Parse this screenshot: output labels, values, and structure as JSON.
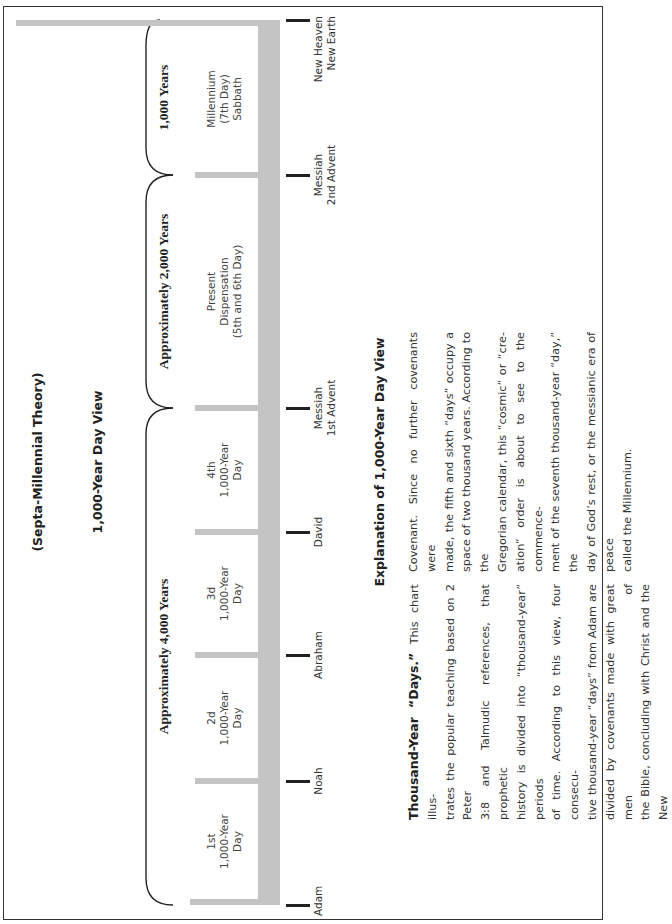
{
  "header": {
    "subtitle": "(Septa-Millennial Theory)",
    "title": "1,000-Year Day View"
  },
  "eras": [
    {
      "label": "Approximately 4,000 Years"
    },
    {
      "label": "Approximately 2,000 Years"
    },
    {
      "label": "1,000 Years"
    }
  ],
  "segments": [
    {
      "line1": "1st",
      "line2": "1,000-Year",
      "line3": "Day"
    },
    {
      "line1": "2d",
      "line2": "1,000-Year",
      "line3": "Day"
    },
    {
      "line1": "3d",
      "line2": "1,000-Year",
      "line3": "Day"
    },
    {
      "line1": "4th",
      "line2": "1,000-Year",
      "line3": "Day"
    },
    {
      "line1": "Present",
      "line2": "Dispensation",
      "line3": "(5th and 6th Day)"
    },
    {
      "line1": "Millennium",
      "line2": "(7th Day)",
      "line3": "Sabbath"
    }
  ],
  "events": [
    {
      "line1": "Adam",
      "line2": ""
    },
    {
      "line1": "Noah",
      "line2": ""
    },
    {
      "line1": "Abraham",
      "line2": ""
    },
    {
      "line1": "David",
      "line2": ""
    },
    {
      "line1": "Messiah",
      "line2": "1st Advent"
    },
    {
      "line1": "Messiah",
      "line2": "2nd Advent"
    },
    {
      "line1": "New Heaven",
      "line2": "New Earth"
    }
  ],
  "explanation": {
    "title": "Explanation of 1,000-Year Day View",
    "lead": "Thousand-Year “Days.”",
    "col1": [
      "This chart illus-",
      "trates the popular teaching based on 2 Peter",
      "3:8 and Talmudic references, that prophetic",
      "history is divided into “thousand-year” periods",
      "of time. According to this view, four consecu-",
      "tive thousand-year “days” from Adam are",
      "divided by covenants made with great men of",
      "the Bible, concluding with Christ and the New"
    ],
    "col2": [
      "Covenant. Since no further covenants were",
      "made, the fifth and sixth “days” occupy a",
      "space of two thousand years. According to the",
      "Gregorian calendar, this “cosmic” or “cre-",
      "ation” order is about to see to the commence-",
      "ment of the seventh thousand-year “day,” the",
      "day of God’s rest, or the messianic era of peace",
      "called the Millennium."
    ]
  },
  "colors": {
    "bar": "#c4c4c4",
    "ink": "#222222",
    "frame": "#333333"
  }
}
